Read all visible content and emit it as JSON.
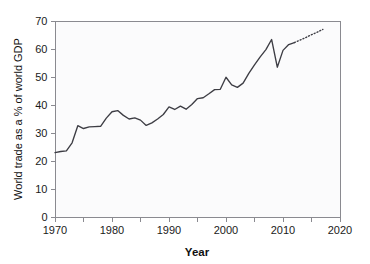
{
  "chart_data": {
    "type": "line",
    "title": "",
    "xlabel": "Year",
    "ylabel": "World trade as a % of world GDP",
    "xlim": [
      1970,
      2020
    ],
    "ylim": [
      0,
      70
    ],
    "grid": false,
    "legend": null,
    "x_ticks": [
      1970,
      1980,
      1990,
      2000,
      2010,
      2020
    ],
    "x_tick_labels": [
      "1970",
      "1980",
      "1990",
      "2000",
      "2010",
      "2020"
    ],
    "x_minor_ticks": [
      1975,
      1985,
      1995,
      2005,
      2015
    ],
    "y_ticks": [
      0,
      10,
      20,
      30,
      40,
      50,
      60,
      70
    ],
    "y_tick_labels": [
      "0",
      "10",
      "20",
      "30",
      "40",
      "50",
      "60",
      "70"
    ],
    "series": [
      {
        "name": "World trade (observed)",
        "style": "solid",
        "color": "#3d3d44",
        "x": [
          1970,
          1971,
          1972,
          1973,
          1974,
          1975,
          1976,
          1977,
          1978,
          1979,
          1980,
          1981,
          1982,
          1983,
          1984,
          1985,
          1986,
          1987,
          1988,
          1989,
          1990,
          1991,
          1992,
          1993,
          1994,
          1995,
          1996,
          1997,
          1998,
          1999,
          2000,
          2001,
          2002,
          2003,
          2004,
          2005,
          2006,
          2007,
          2008,
          2009,
          2010,
          2011,
          2012
        ],
        "values": [
          23.0,
          23.4,
          23.6,
          26.5,
          32.6,
          31.6,
          32.2,
          32.3,
          32.4,
          35.3,
          37.6,
          38.0,
          36.3,
          35.0,
          35.4,
          34.6,
          32.7,
          33.6,
          35.0,
          36.6,
          39.3,
          38.4,
          39.6,
          38.5,
          40.2,
          42.3,
          42.6,
          44.0,
          45.5,
          45.6,
          49.9,
          47.2,
          46.3,
          47.8,
          51.3,
          54.3,
          57.2,
          59.8,
          63.4,
          53.5,
          59.5,
          61.6,
          62.3
        ]
      },
      {
        "name": "World trade (projected)",
        "style": "dotted",
        "color": "#3d3d44",
        "x": [
          2012,
          2013,
          2014,
          2015,
          2016,
          2017
        ],
        "values": [
          62.3,
          63.2,
          64.1,
          65.1,
          66.0,
          67.0
        ]
      }
    ]
  }
}
